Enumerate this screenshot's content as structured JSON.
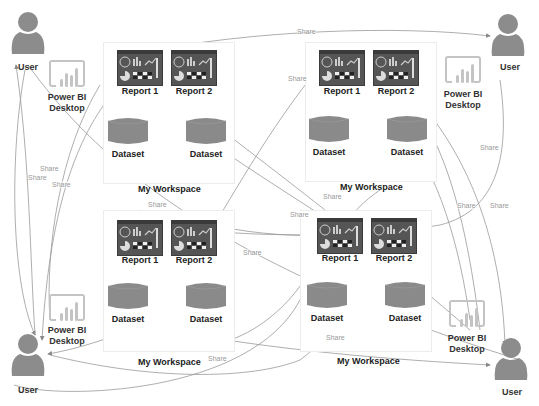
{
  "diagram": {
    "type": "Power BI sharing workspaces",
    "colors": {
      "icon_fill": "#8a8a8a",
      "report_fill": "#555555",
      "line": "#888888",
      "share_text": "#999999",
      "label_text": "#222222"
    },
    "users": [
      {
        "label": "User",
        "position": "top-left"
      },
      {
        "label": "User",
        "position": "top-right"
      },
      {
        "label": "User",
        "position": "bottom-left"
      },
      {
        "label": "User",
        "position": "bottom-right"
      }
    ],
    "desktops": [
      {
        "label_line1": "Power BI",
        "label_line2": "Desktop"
      },
      {
        "label_line1": "Power BI",
        "label_line2": "Desktop"
      },
      {
        "label_line1": "Power BI",
        "label_line2": "Desktop"
      },
      {
        "label_line1": "Power BI",
        "label_line2": "Desktop"
      }
    ],
    "workspaces": [
      {
        "title": "My Workspace",
        "reports": [
          "Report 1",
          "Report 2"
        ],
        "datasets": [
          "Dataset",
          "Dataset"
        ]
      },
      {
        "title": "My Workspace",
        "reports": [
          "Report 1",
          "Report 2"
        ],
        "datasets": [
          "Dataset",
          "Dataset"
        ]
      },
      {
        "title": "My Workspace",
        "reports": [
          "Report 1",
          "Report 2"
        ],
        "datasets": [
          "Dataset",
          "Dataset"
        ]
      },
      {
        "title": "My Workspace",
        "reports": [
          "Report 1",
          "Report 2"
        ],
        "datasets": [
          "Dataset",
          "Dataset"
        ]
      }
    ],
    "connector_label": "Share",
    "share_labels": [
      "Share",
      "Share",
      "Share",
      "Share",
      "Share",
      "Share",
      "Share",
      "Share",
      "Share",
      "Share",
      "Share",
      "Share",
      "Share",
      "Share"
    ]
  }
}
